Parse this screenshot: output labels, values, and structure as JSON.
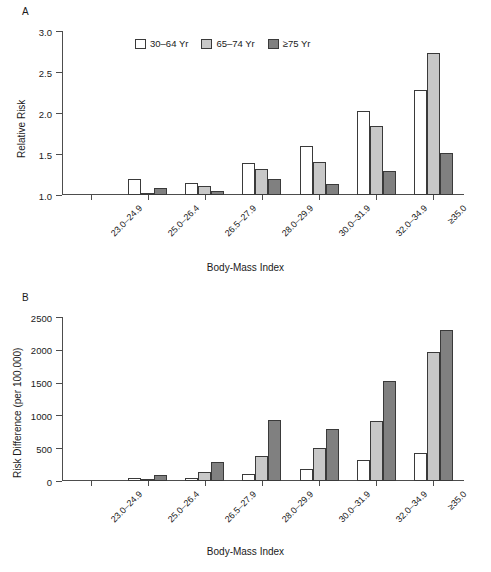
{
  "figure": {
    "panel_a_letter": "A",
    "panel_b_letter": "B"
  },
  "legend": {
    "items": [
      {
        "label": "30–64 Yr",
        "swatch": "white",
        "color": "#ffffff"
      },
      {
        "label": "65–74 Yr",
        "swatch": "light",
        "color": "#c8c8c8"
      },
      {
        "label": "≥75 Yr",
        "swatch": "dark",
        "color": "#808080"
      }
    ]
  },
  "chart_data": [
    {
      "type": "bar",
      "panel": "A",
      "title": "",
      "xlabel": "Body-Mass Index",
      "ylabel": "Relative Risk",
      "ylim": [
        1.0,
        3.0
      ],
      "yticks": [
        1.0,
        1.5,
        2.0,
        2.5,
        3.0
      ],
      "ytick_labels": [
        "1.0",
        "1.5",
        "2.0",
        "2.5",
        "3.0"
      ],
      "grid": false,
      "legend_position": "top-center",
      "categories": [
        "23.0–24.9",
        "25.0–26.4",
        "26.5–27.9",
        "28.0–29.9",
        "30.0–31.9",
        "32.0–34.9",
        "≥35.0"
      ],
      "series": [
        {
          "name": "30–64 Yr",
          "color": "#ffffff",
          "values": [
            1.0,
            1.19,
            1.15,
            1.39,
            1.6,
            2.03,
            2.28
          ]
        },
        {
          "name": "65–74 Yr",
          "color": "#c8c8c8",
          "values": [
            1.0,
            1.03,
            1.11,
            1.32,
            1.4,
            1.84,
            2.73
          ]
        },
        {
          "name": "≥75 Yr",
          "color": "#808080",
          "values": [
            1.0,
            1.09,
            1.05,
            1.2,
            1.13,
            1.29,
            1.51
          ]
        }
      ],
      "note": "23.0–24.9 is the reference category with relative risk 1.0, so no bars rise above the axis."
    },
    {
      "type": "bar",
      "panel": "B",
      "title": "",
      "xlabel": "Body-Mass Index",
      "ylabel": "Risk Difference (per 100,000)",
      "ylim": [
        0,
        2500
      ],
      "yticks": [
        0,
        500,
        1000,
        1500,
        2000,
        2500
      ],
      "ytick_labels": [
        "0",
        "500",
        "1000",
        "1500",
        "2000",
        "2500"
      ],
      "grid": false,
      "legend_position": "top-center",
      "categories": [
        "23.0–24.9",
        "25.0–26.4",
        "26.5–27.9",
        "28.0–29.9",
        "30.0–31.9",
        "32.0–34.9",
        "≥35.0"
      ],
      "series": [
        {
          "name": "30–64 Yr",
          "color": "#ffffff",
          "values": [
            0,
            50,
            45,
            110,
            180,
            315,
            420
          ]
        },
        {
          "name": "65–74 Yr",
          "color": "#c8c8c8",
          "values": [
            0,
            25,
            145,
            380,
            505,
            920,
            1970
          ]
        },
        {
          "name": "≥75 Yr",
          "color": "#808080",
          "values": [
            0,
            85,
            285,
            935,
            800,
            1520,
            2300
          ]
        }
      ],
      "note": "23.0–24.9 is the reference category with risk difference 0, so no bars rise above the axis."
    }
  ]
}
